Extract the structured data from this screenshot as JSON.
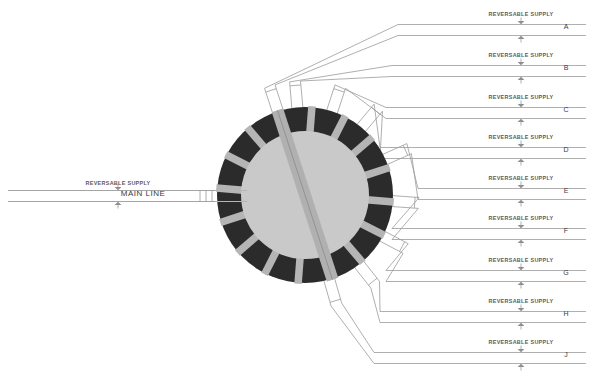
{
  "diagram": {
    "type": "track-schematic",
    "canvas": {
      "width": 592,
      "height": 386,
      "background": "#ffffff"
    },
    "colors": {
      "ring_dark": "#2b2b2b",
      "ring_spoke": "#b5b5b5",
      "inner_disc": "#c9c9c9",
      "bridge_band": "#b0b0b0",
      "track_line": "#9a9a9a",
      "text": "#4a4a4a",
      "arrow": "#8e8e8e"
    },
    "turntable": {
      "label": "turntable",
      "center_x": 305,
      "center_y": 195,
      "outer_radius": 88,
      "inner_radius": 64,
      "spoke_count": 16,
      "bridge_angle_deg": 72
    },
    "main_line": {
      "label": "MAIN LINE",
      "supply_label": "REVERSABLE SUPPLY",
      "y": 196,
      "x_start": 8,
      "x_end": 218,
      "track_gauge": 11,
      "supply_label_x": 118,
      "supply_label_y": 183
    },
    "supply_label_text": "REVERSABLE SUPPLY",
    "branches": [
      {
        "letter": "A",
        "label": "REVERSABLE SUPPLY",
        "y": 30,
        "supply_label_x": 521,
        "bend_x": 398,
        "exit_angle_deg": -108
      },
      {
        "letter": "B",
        "label": "REVERSABLE SUPPLY",
        "y": 71,
        "supply_label_x": 521,
        "bend_x": 392,
        "exit_angle_deg": -95
      },
      {
        "letter": "C",
        "label": "REVERSABLE SUPPLY",
        "y": 113,
        "supply_label_x": 521,
        "bend_x": 386,
        "exit_angle_deg": -72
      },
      {
        "letter": "D",
        "label": "REVERSABLE SUPPLY",
        "y": 153,
        "supply_label_x": 521,
        "bend_x": 380,
        "exit_angle_deg": -50
      },
      {
        "letter": "E",
        "label": "REVERSABLE SUPPLY",
        "y": 194,
        "supply_label_x": 521,
        "bend_x": 418,
        "exit_angle_deg": -24
      },
      {
        "letter": "F",
        "label": "REVERSABLE SUPPLY",
        "y": 234,
        "supply_label_x": 521,
        "bend_x": 392,
        "exit_angle_deg": 4
      },
      {
        "letter": "G",
        "label": "REVERSABLE SUPPLY",
        "y": 276,
        "supply_label_x": 521,
        "bend_x": 386,
        "exit_angle_deg": 28
      },
      {
        "letter": "H",
        "label": "REVERSABLE SUPPLY",
        "y": 317,
        "supply_label_x": 521,
        "bend_x": 380,
        "exit_angle_deg": 52
      },
      {
        "letter": "J",
        "label": "REVERSABLE SUPPLY",
        "y": 358,
        "supply_label_x": 521,
        "bend_x": 374,
        "exit_angle_deg": 74
      }
    ],
    "branch_right_edge_x": 586,
    "branch_letter_x": 566,
    "track_gauge_px": 11
  }
}
